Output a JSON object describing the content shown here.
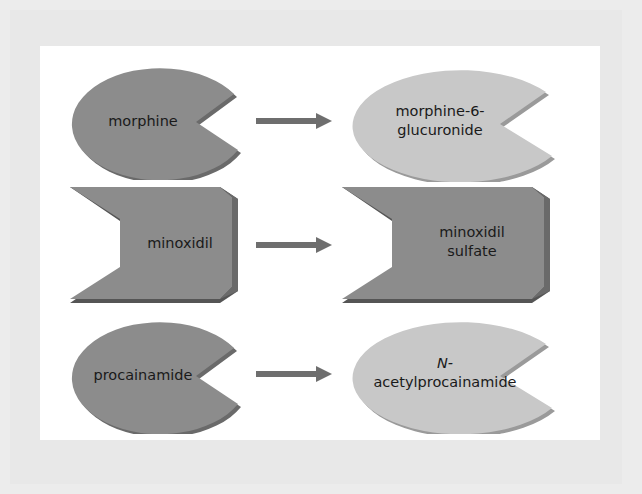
{
  "diagram": {
    "colors": {
      "dark_shape": "#8c8c8c",
      "light_shape": "#c8c8c8",
      "arrow": "#6e6e6e",
      "frame": "#e8e8e8",
      "panel": "#ffffff"
    },
    "rows": [
      {
        "substrate": "morphine",
        "substrate_shape": "pac-ellipse",
        "product_line1": "morphine-6-",
        "product_line2": "glucuronide",
        "product_shape": "pac-ellipse"
      },
      {
        "substrate": "minoxidil",
        "substrate_shape": "notched-block",
        "product_line1": "minoxidil",
        "product_line2": "sulfate",
        "product_shape": "notched-block"
      },
      {
        "substrate": "procainamide",
        "substrate_shape": "pac-ellipse",
        "product_line1": "N-",
        "product_line2": "acetylprocainamide",
        "product_shape": "pac-ellipse"
      }
    ],
    "arrow_icon": "right-arrow-icon"
  }
}
